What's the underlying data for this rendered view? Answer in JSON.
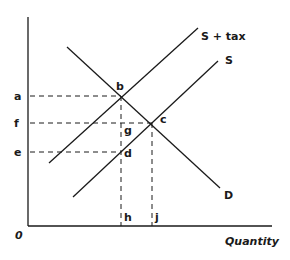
{
  "diagram": {
    "type": "supply-demand-tax",
    "axes": {
      "origin_label": "0",
      "x_label": "Quantity"
    },
    "curves": [
      {
        "id": "demand",
        "label": "D"
      },
      {
        "id": "supply",
        "label": "S"
      },
      {
        "id": "supply_tax",
        "label": "S + tax"
      }
    ],
    "price_labels": [
      "a",
      "f",
      "e"
    ],
    "quantity_labels": [
      "h",
      "j"
    ],
    "points": [
      "b",
      "c",
      "d",
      "g"
    ],
    "colors": {
      "line": "#1a1a1a",
      "background": "#ffffff"
    }
  }
}
